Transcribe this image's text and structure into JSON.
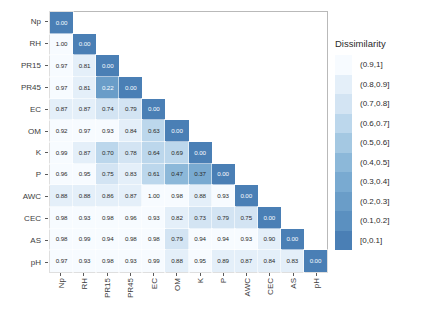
{
  "chart_data": {
    "type": "heatmap",
    "title": "",
    "xlabel": "",
    "ylabel": "",
    "legend_title": "Dissimilarity",
    "legend_position": "right",
    "grid": false,
    "triangle": "lower",
    "categories": [
      "Np",
      "RH",
      "PR15",
      "PR45",
      "EC",
      "OM",
      "K",
      "P",
      "AWC",
      "CEC",
      "AS",
      "pH"
    ],
    "x_tick_labels": [
      "Np",
      "RH",
      "PR15",
      "PR45",
      "EC",
      "OM",
      "K",
      "P",
      "AWC",
      "CEC",
      "AS",
      "pH"
    ],
    "y_tick_labels": [
      "Np",
      "RH",
      "PR15",
      "PR45",
      "EC",
      "OM",
      "K",
      "P",
      "AWC",
      "CEC",
      "AS",
      "pH"
    ],
    "zlim": [
      0,
      1
    ],
    "rows": [
      {
        "label": "Np",
        "values": [
          0.0,
          null,
          null,
          null,
          null,
          null,
          null,
          null,
          null,
          null,
          null,
          null
        ]
      },
      {
        "label": "RH",
        "values": [
          1.0,
          0.0,
          null,
          null,
          null,
          null,
          null,
          null,
          null,
          null,
          null,
          null
        ]
      },
      {
        "label": "PR15",
        "values": [
          0.97,
          0.81,
          0.0,
          null,
          null,
          null,
          null,
          null,
          null,
          null,
          null,
          null
        ]
      },
      {
        "label": "PR45",
        "values": [
          0.97,
          0.81,
          0.22,
          0.0,
          null,
          null,
          null,
          null,
          null,
          null,
          null,
          null
        ]
      },
      {
        "label": "EC",
        "values": [
          0.87,
          0.87,
          0.74,
          0.79,
          0.0,
          null,
          null,
          null,
          null,
          null,
          null,
          null
        ]
      },
      {
        "label": "OM",
        "values": [
          0.92,
          0.97,
          0.93,
          0.84,
          0.63,
          0.0,
          null,
          null,
          null,
          null,
          null,
          null
        ]
      },
      {
        "label": "K",
        "values": [
          0.99,
          0.87,
          0.7,
          0.78,
          0.64,
          0.69,
          0.0,
          null,
          null,
          null,
          null,
          null
        ]
      },
      {
        "label": "P",
        "values": [
          0.96,
          0.95,
          0.75,
          0.83,
          0.61,
          0.47,
          0.37,
          0.0,
          null,
          null,
          null,
          null
        ]
      },
      {
        "label": "AWC",
        "values": [
          0.88,
          0.88,
          0.86,
          0.87,
          1.0,
          0.98,
          0.88,
          0.93,
          0.0,
          null,
          null,
          null
        ]
      },
      {
        "label": "CEC",
        "values": [
          0.98,
          0.93,
          0.98,
          0.96,
          0.93,
          0.82,
          0.73,
          0.79,
          0.75,
          0.0,
          null,
          null
        ]
      },
      {
        "label": "AS",
        "values": [
          0.98,
          0.99,
          0.94,
          0.98,
          0.98,
          0.79,
          0.94,
          0.94,
          0.93,
          0.9,
          0.0,
          null
        ]
      },
      {
        "label": "pH",
        "values": [
          0.97,
          0.93,
          0.98,
          0.93,
          0.99,
          0.88,
          0.95,
          0.89,
          0.87,
          0.84,
          0.83,
          0.0
        ]
      }
    ],
    "legend_bins": [
      {
        "label": "(0.9,1]",
        "color": "#f7fbff",
        "min": 0.9,
        "max": 1.0
      },
      {
        "label": "(0.8,0.9]",
        "color": "#e4eff9",
        "min": 0.8,
        "max": 0.9
      },
      {
        "label": "(0.7,0.8]",
        "color": "#d3e4f3",
        "min": 0.7,
        "max": 0.8
      },
      {
        "label": "(0.6,0.7]",
        "color": "#bcd7ec",
        "min": 0.6,
        "max": 0.7
      },
      {
        "label": "(0.5,0.6]",
        "color": "#a4c8e2",
        "min": 0.5,
        "max": 0.6
      },
      {
        "label": "(0.4,0.5]",
        "color": "#8cb8d9",
        "min": 0.4,
        "max": 0.5
      },
      {
        "label": "(0.3,0.4]",
        "color": "#79aad1",
        "min": 0.3,
        "max": 0.4
      },
      {
        "label": "(0.2,0.3]",
        "color": "#6a9dc8",
        "min": 0.2,
        "max": 0.3
      },
      {
        "label": "(0.1,0.2]",
        "color": "#5b90c0",
        "min": 0.1,
        "max": 0.2
      },
      {
        "label": "[0,0.1]",
        "color": "#4a7fb5",
        "min": 0.0,
        "max": 0.1
      }
    ]
  }
}
